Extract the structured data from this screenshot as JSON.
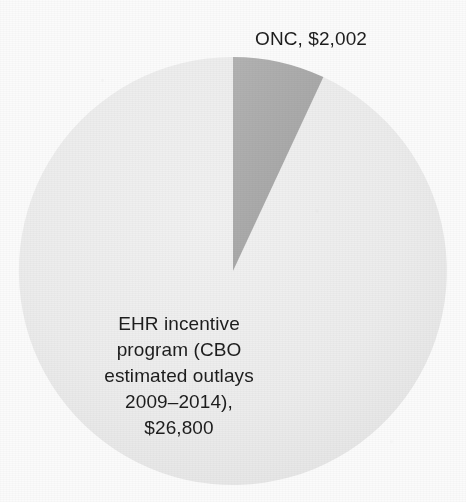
{
  "figure": {
    "background_color": "#fbfbfb",
    "text_color": "#1d1d1d"
  },
  "chart_data": {
    "type": "pie",
    "title": "",
    "subtitle": "",
    "xlabel": "",
    "ylabel": "",
    "grid": false,
    "legend_position": "none",
    "units": "millions of dollars",
    "total": 28802,
    "categories": [
      "ONC",
      "EHR incentive program (CBO estimated outlays 2009–2014)"
    ],
    "values": [
      2002,
      26800
    ],
    "percentages": [
      6.95,
      93.05
    ],
    "start_angle_deg": 0,
    "direction": "clockwise",
    "center": {
      "x": 233,
      "y": 271
    },
    "radius": 214,
    "slices": [
      {
        "name": "ONC",
        "value": 2002,
        "value_label": "$2,002",
        "percent": 6.95,
        "color": "#a9a9a9",
        "start_angle_deg": 0,
        "end_angle_deg": 25.0,
        "label_lines": [
          "ONC, $2,002"
        ],
        "label_position": "outside-top"
      },
      {
        "name": "EHR incentive program (CBO estimated outlays 2009–2014)",
        "value": 26800,
        "value_label": "$26,800",
        "percent": 93.05,
        "color": "#ececec",
        "start_angle_deg": 25.0,
        "end_angle_deg": 360.0,
        "label_lines": [
          "EHR incentive",
          "program (CBO",
          "estimated outlays",
          "2009–2014),",
          "$26,800"
        ],
        "label_position": "inside-center"
      }
    ]
  },
  "labels": {
    "onc": "ONC, $2,002",
    "ehr": "EHR incentive\nprogram (CBO\nestimated outlays\n2009–2014),\n$26,800"
  }
}
